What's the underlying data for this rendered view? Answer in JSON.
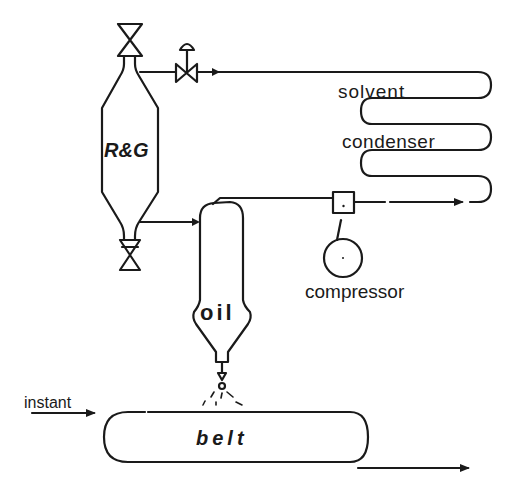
{
  "diagram": {
    "type": "process-flow",
    "stroke_color": "#1a1a1a",
    "background": "#ffffff",
    "labels": {
      "vessel": "R&G",
      "condenser_line1": "solvent",
      "condenser_line2": "condenser",
      "compressor": "compressor",
      "separator": "oil",
      "input": "instant",
      "belt": "belt"
    },
    "components": [
      {
        "id": "rg-vessel",
        "label": "R&G"
      },
      {
        "id": "top-valve"
      },
      {
        "id": "bottom-valve"
      },
      {
        "id": "control-valve"
      },
      {
        "id": "solvent-condenser",
        "label": "solvent condenser"
      },
      {
        "id": "compressor",
        "label": "compressor"
      },
      {
        "id": "oil-separator",
        "label": "oil"
      },
      {
        "id": "spray-nozzle"
      },
      {
        "id": "belt",
        "label": "belt"
      }
    ],
    "flows": [
      {
        "from": "solvent-condenser",
        "to": "control-valve",
        "direction": "left"
      },
      {
        "from": "control-valve",
        "to": "rg-vessel",
        "direction": "left"
      },
      {
        "from": "rg-vessel",
        "to": "oil-separator",
        "direction": "right"
      },
      {
        "from": "oil-separator",
        "to": "compressor",
        "direction": "right"
      },
      {
        "from": "compressor",
        "to": "solvent-condenser",
        "direction": "right"
      },
      {
        "from": "oil-separator",
        "to": "belt",
        "direction": "down"
      },
      {
        "from": "instant",
        "to": "belt",
        "direction": "right"
      },
      {
        "from": "belt",
        "to": "output",
        "direction": "right"
      }
    ]
  }
}
